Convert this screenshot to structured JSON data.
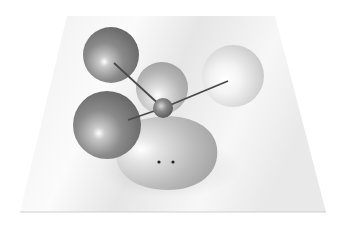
{
  "figure": {
    "type": "3d-molecular-model",
    "background": "#ffffff",
    "plane": {
      "points": [
        [
          67,
          16
        ],
        [
          275,
          16
        ],
        [
          326,
          212
        ],
        [
          20,
          212
        ]
      ],
      "color_light": "#f4f4f4",
      "color_shade": "#dcdcdc",
      "edge_color": "#c8c8c8"
    },
    "atoms": [
      {
        "id": "orbital-top-left",
        "cx": 111,
        "cy": 55,
        "r": 28,
        "shade": "dark",
        "base": "#7a7a7a",
        "highlight": "#ffffff"
      },
      {
        "id": "orbital-center-back",
        "cx": 162,
        "cy": 88,
        "r": 26,
        "shade": "medium",
        "base": "#b2b2b2",
        "highlight": "#ffffff"
      },
      {
        "id": "orbital-right",
        "cx": 233,
        "cy": 76,
        "r": 31,
        "shade": "light",
        "base": "#cfcfcf",
        "highlight": "#ffffff"
      },
      {
        "id": "orbital-left",
        "cx": 107,
        "cy": 125,
        "r": 34,
        "shade": "dark",
        "base": "#6e6e6e",
        "highlight": "#ffffff"
      }
    ],
    "lone_pair": {
      "cx": 168,
      "cy": 153,
      "rx": 52,
      "ry": 38,
      "base": "#bdbdbd",
      "dots": [
        [
          159,
          162
        ],
        [
          173,
          162
        ]
      ],
      "dot_color": "#222222"
    },
    "central_atom": {
      "cx": 163,
      "cy": 108,
      "r": 10,
      "base": "#6a6a6a"
    },
    "bonds": [
      {
        "from": [
          163,
          108
        ],
        "to": [
          114,
          63
        ]
      },
      {
        "from": [
          163,
          108
        ],
        "to": [
          228,
          81
        ]
      },
      {
        "from": [
          163,
          108
        ],
        "to": [
          128,
          120
        ]
      }
    ],
    "bond_color": "#4a4a4a"
  }
}
